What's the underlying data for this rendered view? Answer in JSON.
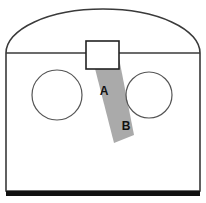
{
  "figure": {
    "width": 206,
    "height": 203,
    "background_color": "#ffffff"
  },
  "colors": {
    "outline": "#3a3a3a",
    "circle_outline": "#555555",
    "band_fill": "#aaaaaa",
    "base_bar": "#111111",
    "label_color": "#111111",
    "background": "#ffffff"
  },
  "shapes": {
    "outer_body": {
      "name": "arched-enclosure",
      "left_x": 6,
      "right_x": 200,
      "arch_apex_y": 9,
      "spring_line_y": 53,
      "bottom_y": 191,
      "stroke_width": 1.6
    },
    "divider_line": {
      "name": "horizontal-divider",
      "y": 53,
      "from_x": 6,
      "to_x": 200
    },
    "base_bar": {
      "name": "base-bar",
      "y": 191,
      "height": 5,
      "from_x": 6,
      "to_x": 200
    },
    "left_circle": {
      "name": "left-circle",
      "cx": 57,
      "cy": 95,
      "r": 25
    },
    "right_circle": {
      "name": "right-circle",
      "cx": 149,
      "cy": 95,
      "r": 23
    },
    "top_rectangle": {
      "name": "top-rectangle",
      "x": 86,
      "y": 41,
      "width": 33,
      "height": 28
    },
    "shaded_band": {
      "name": "shaded-band",
      "points": "91,53 118,53 134,135 114,143"
    }
  },
  "labels": [
    {
      "id": "label-a",
      "text": "A",
      "x": 104,
      "y": 95
    },
    {
      "id": "label-b",
      "text": "B",
      "x": 126,
      "y": 130
    }
  ]
}
